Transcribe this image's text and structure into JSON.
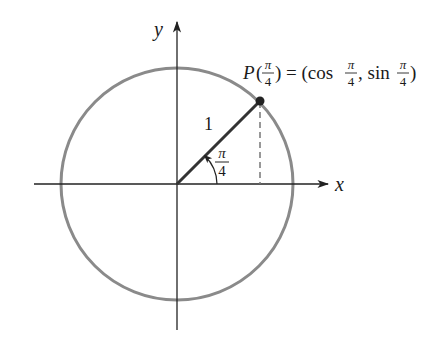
{
  "diagram": {
    "type": "unit-circle",
    "axes": {
      "x_label": "x",
      "y_label": "y"
    },
    "circle": {
      "center": [
        0,
        0
      ],
      "radius": 1,
      "color": "#8a8a8a"
    },
    "radius_segment": {
      "label": "1",
      "color": "#333333"
    },
    "angle": {
      "label_num": "π",
      "label_den": "4",
      "value": "π/4"
    },
    "point": {
      "label_prefix": "P(",
      "label_arg_num": "π",
      "label_arg_den": "4",
      "label_mid": ") = (cos ",
      "cos_num": "π",
      "cos_den": "4",
      "label_sep": ", sin ",
      "sin_num": "π",
      "sin_den": "4",
      "label_suffix": ")",
      "full_text": "P(π/4) = (cos π/4, sin π/4)"
    },
    "projection": {
      "style": "dashed"
    }
  }
}
